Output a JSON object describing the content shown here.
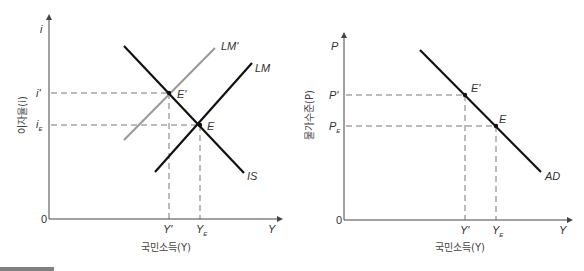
{
  "left_panel": {
    "y_axis_symbol": "i",
    "y_axis_title": "이자율(i)",
    "x_axis_symbol": "Y",
    "x_axis_title": "국민소득(Y)",
    "origin": "0",
    "y_ticks": [
      {
        "label": "i'",
        "sub": ""
      },
      {
        "label": "i",
        "sub": "E"
      }
    ],
    "x_ticks": [
      {
        "label": "Y'",
        "sub": ""
      },
      {
        "label": "Y",
        "sub": "E"
      }
    ],
    "curves": [
      {
        "name": "IS",
        "color": "#111111"
      },
      {
        "name": "LM",
        "color": "#111111"
      },
      {
        "name": "LM'",
        "color": "#999999"
      }
    ],
    "points": [
      {
        "name": "E'"
      },
      {
        "name": "E"
      }
    ]
  },
  "right_panel": {
    "y_axis_symbol": "P",
    "y_axis_title": "물가수준(P)",
    "x_axis_symbol": "Y",
    "x_axis_title": "국민소득(Y)",
    "origin": "0",
    "y_ticks": [
      {
        "label": "P'",
        "sub": ""
      },
      {
        "label": "P",
        "sub": "E"
      }
    ],
    "x_ticks": [
      {
        "label": "Y'",
        "sub": ""
      },
      {
        "label": "Y",
        "sub": "E"
      }
    ],
    "curves": [
      {
        "name": "AD",
        "color": "#111111"
      }
    ],
    "points": [
      {
        "name": "E'"
      },
      {
        "name": "E"
      }
    ]
  }
}
